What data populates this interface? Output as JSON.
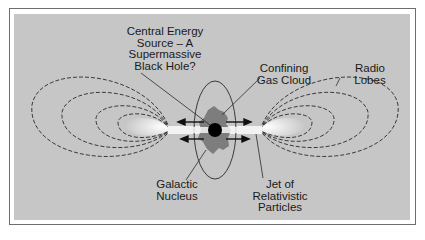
{
  "diagram": {
    "colors": {
      "background": "#ffffff",
      "frame_border": "#6e6e6e",
      "panel": "#c6c6c6",
      "lines": "#2a2a2a",
      "gas_cloud": "#7d7d7d",
      "black_hole": "#000000",
      "jet": "#f2f2f2"
    },
    "labels": {
      "central_energy_source": "Central Energy\nSource – A\nSupermassive\nBlack Hole?",
      "confining_gas_cloud": "Confining\nGas Cloud",
      "radio_lobes": "Radio\nLobes",
      "galactic_nucleus": "Galactic\nNucleus",
      "jet": "Jet of\nRelativistic\nParticles"
    },
    "nodes": [
      {
        "id": "black-hole",
        "label": "Central Energy Source – A Supermassive Black Hole?"
      },
      {
        "id": "gas-cloud",
        "label": "Confining Gas Cloud"
      },
      {
        "id": "radio-lobes",
        "label": "Radio Lobes"
      },
      {
        "id": "galactic-nucleus",
        "label": "Galactic Nucleus"
      },
      {
        "id": "jet",
        "label": "Jet of Relativistic Particles"
      }
    ]
  }
}
